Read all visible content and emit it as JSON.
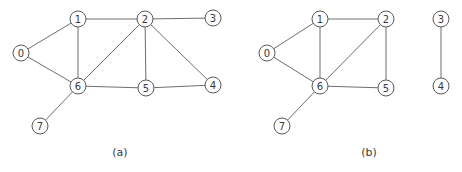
{
  "figure": {
    "panels": [
      {
        "id": "a",
        "caption": "(a)",
        "caption_pos": [
          120,
          156
        ],
        "nodes": [
          {
            "label": "0",
            "x": 21,
            "y": 53
          },
          {
            "label": "1",
            "x": 78,
            "y": 19
          },
          {
            "label": "2",
            "x": 145,
            "y": 19
          },
          {
            "label": "3",
            "x": 213,
            "y": 18
          },
          {
            "label": "4",
            "x": 213,
            "y": 85
          },
          {
            "label": "5",
            "x": 146,
            "y": 88
          },
          {
            "label": "6",
            "x": 78,
            "y": 86
          },
          {
            "label": "7",
            "x": 40,
            "y": 126
          }
        ],
        "edges": [
          [
            "0",
            "1"
          ],
          [
            "0",
            "6"
          ],
          [
            "1",
            "2"
          ],
          [
            "1",
            "6"
          ],
          [
            "2",
            "3"
          ],
          [
            "2",
            "6"
          ],
          [
            "2",
            "5"
          ],
          [
            "2",
            "4"
          ],
          [
            "6",
            "5"
          ],
          [
            "5",
            "4"
          ],
          [
            "6",
            "7"
          ]
        ]
      },
      {
        "id": "b",
        "caption": "(b)",
        "caption_pos": [
          369,
          156
        ],
        "nodes": [
          {
            "label": "0",
            "x": 267,
            "y": 53
          },
          {
            "label": "1",
            "x": 320,
            "y": 19
          },
          {
            "label": "2",
            "x": 386,
            "y": 19
          },
          {
            "label": "3",
            "x": 441,
            "y": 19
          },
          {
            "label": "4",
            "x": 441,
            "y": 86
          },
          {
            "label": "5",
            "x": 386,
            "y": 88
          },
          {
            "label": "6",
            "x": 320,
            "y": 86
          },
          {
            "label": "7",
            "x": 282,
            "y": 126
          }
        ],
        "edges": [
          [
            "0",
            "1"
          ],
          [
            "0",
            "6"
          ],
          [
            "1",
            "2"
          ],
          [
            "1",
            "6"
          ],
          [
            "2",
            "6"
          ],
          [
            "2",
            "5"
          ],
          [
            "6",
            "5"
          ],
          [
            "6",
            "7"
          ],
          [
            "3",
            "4"
          ]
        ]
      }
    ],
    "node_radius": 8,
    "colors": {
      "edge": "#6e6e6e",
      "node_stroke": "#5a5a5a",
      "text": "#3a3a3a",
      "background": "#ffffff"
    }
  }
}
